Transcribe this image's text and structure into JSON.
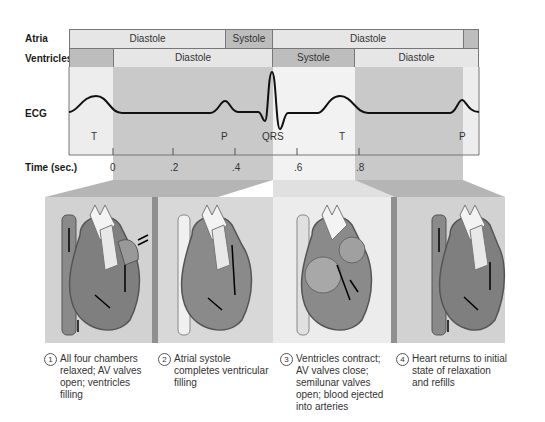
{
  "rows": {
    "atria_label": "Atria",
    "ventricles_label": "Ventricles",
    "ecg_label": "ECG",
    "time_label": "Time (sec.)"
  },
  "atria_segments": [
    {
      "label": "Diastole",
      "state": "diastole"
    },
    {
      "label": "Systole",
      "state": "systole"
    },
    {
      "label": "Diastole",
      "state": "diastole"
    },
    {
      "label": "",
      "state": "systole"
    }
  ],
  "ventricle_segments": [
    {
      "label": "",
      "state": "systole"
    },
    {
      "label": "Diastole",
      "state": "diastole"
    },
    {
      "label": "Systole",
      "state": "systole"
    },
    {
      "label": "Diastole",
      "state": "diastole"
    }
  ],
  "ecg_waves": [
    "T",
    "P",
    "QRS",
    "T",
    "P"
  ],
  "time_ticks": [
    "0",
    ".2",
    ".4",
    ".6",
    ".8"
  ],
  "colors": {
    "diastole": "#e6e6e6",
    "systole": "#bdbdbd",
    "shade": "#c8c8c8",
    "ecg_line": "#111111"
  },
  "panels": [
    {
      "num": "1",
      "caption": "All four chambers relaxed; AV valves open; ventricles filling"
    },
    {
      "num": "2",
      "caption": "Atrial systole completes ventricular filling"
    },
    {
      "num": "3",
      "caption": "Ventricles contract; AV valves close; semilunar valves open; blood ejected into arteries"
    },
    {
      "num": "4",
      "caption": "Heart returns to initial state of relaxation and refills"
    }
  ]
}
